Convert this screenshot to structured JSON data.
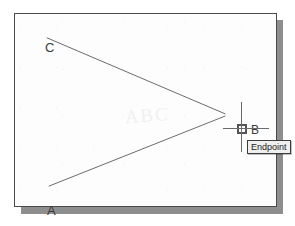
{
  "window": {
    "name": "cad-drawing-window",
    "background_color": "#fdfdfd",
    "border_color": "#4a4a4a",
    "shadow_color": "#8e8e8e"
  },
  "drawing": {
    "line_color": "#5a5a5a",
    "watermark_text": "ABC",
    "vertices": [
      {
        "id": "C",
        "label": "C",
        "x": 45,
        "y": 36
      },
      {
        "id": "B",
        "label": "B",
        "x": 227,
        "y": 115
      },
      {
        "id": "A",
        "label": "A",
        "x": 47,
        "y": 188
      }
    ],
    "segments": [
      {
        "name": "segment-cb",
        "from": "C",
        "to": "B",
        "x1": 46,
        "y1": 37,
        "x2": 226,
        "y2": 114
      },
      {
        "name": "segment-ab",
        "from": "A",
        "to": "B",
        "x1": 48,
        "y1": 187,
        "x2": 226,
        "y2": 116
      }
    ]
  },
  "cursor": {
    "name": "crosshair-cursor",
    "x": 227,
    "y": 115,
    "color": "#6b6b6b",
    "vertical_length": 50,
    "horizontal_length": 46
  },
  "osnap": {
    "marker_type": "endpoint-square",
    "marker_color": "#555555",
    "tooltip_label": "Endpoint",
    "tooltip_background": "#efefef",
    "tooltip_border": "#3c3c3c",
    "tooltip_text_color": "#1c1c1c"
  }
}
